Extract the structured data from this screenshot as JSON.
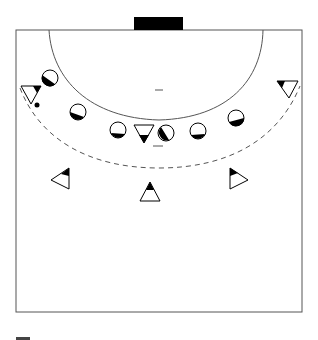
{
  "diagram": {
    "colors": {
      "line": "#555555",
      "fill": "#000000",
      "background": "#ffffff"
    },
    "court": {
      "x": 16,
      "y": 30,
      "width": 286,
      "height": 282
    },
    "goal": {
      "x": 134,
      "y": 17,
      "width": 49,
      "height": 13
    },
    "goal_area_arc": {
      "label": "6m line"
    },
    "free_throw_arc": {
      "label": "9m dashed line"
    },
    "center_mark": {
      "x1": 155,
      "x2": 163,
      "y": 90
    },
    "penalty_mark": {
      "x1": 153,
      "x2": 163,
      "y": 146
    },
    "legend_mark": {
      "x": 16,
      "y": 337,
      "width": 14,
      "height": 3
    },
    "defenders": [
      {
        "id": "d1",
        "cx": 50,
        "cy": 78
      },
      {
        "id": "d2",
        "cx": 78,
        "cy": 112
      },
      {
        "id": "d3",
        "cx": 118,
        "cy": 130
      },
      {
        "id": "d4",
        "cx": 166,
        "cy": 133
      },
      {
        "id": "d5",
        "cx": 198,
        "cy": 131
      },
      {
        "id": "d6",
        "cx": 236,
        "cy": 118
      }
    ],
    "attackers": [
      {
        "id": "a-left-wing",
        "type": "down",
        "cx": 31,
        "cy": 95
      },
      {
        "id": "a-pivot",
        "type": "down",
        "cx": 144,
        "cy": 130
      },
      {
        "id": "a-right-wing",
        "type": "down",
        "cx": 289,
        "cy": 88
      },
      {
        "id": "a-left-back",
        "type": "left",
        "cx": 62,
        "cy": 180
      },
      {
        "id": "a-center-back",
        "type": "up",
        "cx": 150,
        "cy": 193
      },
      {
        "id": "a-right-back",
        "type": "right",
        "cx": 237,
        "cy": 180
      }
    ],
    "ball": {
      "cx": 37,
      "cy": 105,
      "r": 2.5
    }
  }
}
